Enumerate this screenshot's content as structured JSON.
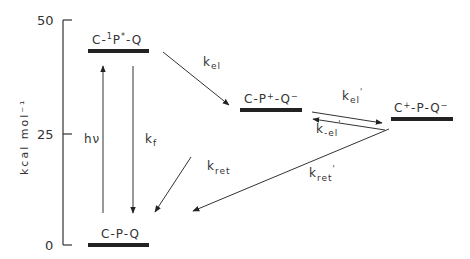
{
  "axis": {
    "label": "kcal mol⁻¹",
    "ticks": [
      {
        "value": "50",
        "y": 20
      },
      {
        "value": "25",
        "y": 134
      },
      {
        "value": "0",
        "y": 245
      }
    ]
  },
  "states": [
    {
      "id": "excited",
      "label_parts": [
        "C-",
        "1",
        "P",
        "*",
        "-Q"
      ],
      "energy": 43
    },
    {
      "id": "cp_radical",
      "label_parts": [
        "C-P",
        "+",
        "-Q",
        "−"
      ],
      "energy": 30
    },
    {
      "id": "c_radical",
      "label_parts": [
        "C",
        "+",
        "-P-Q",
        "−"
      ],
      "energy": 28
    },
    {
      "id": "ground",
      "label": "C-P-Q",
      "energy": 0
    }
  ],
  "processes": [
    {
      "id": "hv",
      "label": "hν",
      "from": "ground",
      "to": "excited"
    },
    {
      "id": "kf",
      "label": "k",
      "sub": "f",
      "from": "excited",
      "to": "ground"
    },
    {
      "id": "kel",
      "label": "k",
      "sub": "el",
      "from": "excited",
      "to": "cp_radical"
    },
    {
      "id": "kel_prime",
      "label": "k",
      "sub": "el",
      "prime": "'",
      "from": "cp_radical",
      "to": "c_radical"
    },
    {
      "id": "k_minus_el_prime",
      "label": "k",
      "sub": "-el",
      "prime": "'",
      "from": "c_radical",
      "to": "cp_radical"
    },
    {
      "id": "kret",
      "label": "k",
      "sub": "ret",
      "from": "cp_radical",
      "to": "ground"
    },
    {
      "id": "kret_prime",
      "label": "k",
      "sub": "ret",
      "prime": "'",
      "from": "c_radical",
      "to": "ground"
    }
  ]
}
